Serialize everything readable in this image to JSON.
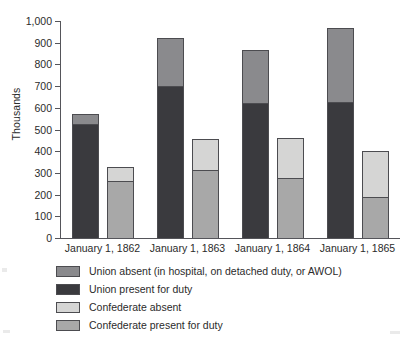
{
  "chart_data": {
    "type": "bar",
    "subtype": "grouped-stacked-column",
    "title": "",
    "xlabel": "",
    "ylabel": "Thousands",
    "ylim": [
      0,
      1000
    ],
    "yticks": [
      0,
      100,
      200,
      300,
      400,
      500,
      600,
      700,
      800,
      900,
      1000
    ],
    "ytick_labels": [
      "0",
      "100",
      "200",
      "300",
      "400",
      "500",
      "600",
      "700",
      "800",
      "900",
      "1,000"
    ],
    "grid": false,
    "legend_position": "below-plot",
    "categories": [
      "January 1, 1862",
      "January 1, 1863",
      "January 1, 1864",
      "January 1, 1865"
    ],
    "series": [
      {
        "name": "Union present for duty",
        "stack": "Union",
        "color": "#3a3a3e",
        "values": [
          527,
          700,
          620,
          625
        ]
      },
      {
        "name": "Union absent (in hospital, on detached duty, or AWOL)",
        "stack": "Union",
        "color": "#8a8a8d",
        "values": [
          45,
          220,
          248,
          343
        ]
      },
      {
        "name": "Confederate present for duty",
        "stack": "Confederate",
        "color": "#a8a8a8",
        "values": [
          263,
          312,
          277,
          187
        ]
      },
      {
        "name": "Confederate absent",
        "stack": "Confederate",
        "color": "#d5d5d4",
        "values": [
          63,
          143,
          185,
          213
        ]
      }
    ],
    "stack_totals": {
      "Union": [
        572,
        920,
        868,
        968
      ],
      "Confederate": [
        326,
        455,
        462,
        400
      ]
    }
  },
  "axes": {
    "y_title": "Thousands",
    "tick_labels": [
      "1,000",
      "900",
      "800",
      "700",
      "600",
      "500",
      "400",
      "300",
      "200",
      "100",
      "0"
    ],
    "tick_values": [
      1000,
      900,
      800,
      700,
      600,
      500,
      400,
      300,
      200,
      100,
      0
    ],
    "category_labels": [
      "January 1, 1862",
      "January 1, 1863",
      "January 1, 1864",
      "January 1, 1865"
    ]
  },
  "legend": {
    "items": [
      {
        "label": "Union absent (in hospital, on detached duty, or AWOL)",
        "color": "#8a8a8d"
      },
      {
        "label": "Union present for duty",
        "color": "#3a3a3e"
      },
      {
        "label": "Confederate absent",
        "color": "#d5d5d4"
      },
      {
        "label": "Confederate present for duty",
        "color": "#a8a8a8"
      }
    ]
  },
  "colors": {
    "union_absent": "#8a8a8d",
    "union_present": "#3a3a3e",
    "confederate_absent": "#d5d5d4",
    "confederate_present": "#a8a8a8",
    "axis": "#55555a",
    "text": "#2b2b2b",
    "background": "#ffffff"
  }
}
